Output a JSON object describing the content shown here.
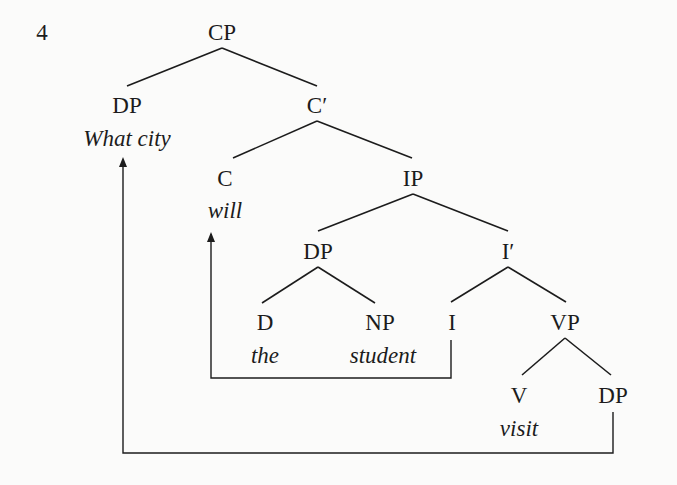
{
  "example_number": "4",
  "tree": {
    "nodes": [
      {
        "id": "cp",
        "label": "CP",
        "x": 222,
        "y": 32
      },
      {
        "id": "dp-spec",
        "label": "DP",
        "x": 127,
        "y": 105,
        "word": "What city",
        "wx": 127,
        "wy": 138
      },
      {
        "id": "c-bar",
        "label": "C′",
        "x": 317,
        "y": 105
      },
      {
        "id": "c",
        "label": "C",
        "x": 225,
        "y": 178,
        "word": "will",
        "wx": 225,
        "wy": 210
      },
      {
        "id": "ip",
        "label": "IP",
        "x": 413,
        "y": 178
      },
      {
        "id": "dp-subj",
        "label": "DP",
        "x": 318,
        "y": 251
      },
      {
        "id": "i-bar",
        "label": "I′",
        "x": 508,
        "y": 251
      },
      {
        "id": "d",
        "label": "D",
        "x": 265,
        "y": 322,
        "word": "the",
        "wx": 265,
        "wy": 355
      },
      {
        "id": "np",
        "label": "NP",
        "x": 380,
        "y": 322,
        "word": "student",
        "wx": 383,
        "wy": 355
      },
      {
        "id": "i",
        "label": "I",
        "x": 452,
        "y": 322
      },
      {
        "id": "vp",
        "label": "VP",
        "x": 565,
        "y": 322
      },
      {
        "id": "v",
        "label": "V",
        "x": 519,
        "y": 395,
        "word": "visit",
        "wx": 519,
        "wy": 428
      },
      {
        "id": "dp-obj",
        "label": "DP",
        "x": 613,
        "y": 395
      }
    ],
    "edges": [
      [
        222,
        48,
        127,
        86
      ],
      [
        222,
        48,
        317,
        86
      ],
      [
        317,
        121,
        233,
        158
      ],
      [
        317,
        121,
        412,
        158
      ],
      [
        413,
        194,
        318,
        231
      ],
      [
        413,
        194,
        508,
        231
      ],
      [
        318,
        267,
        262,
        303
      ],
      [
        318,
        267,
        375,
        303
      ],
      [
        508,
        267,
        451,
        302
      ],
      [
        508,
        267,
        566,
        302
      ],
      [
        565,
        338,
        522,
        375
      ],
      [
        565,
        338,
        611,
        375
      ]
    ],
    "movements": [
      {
        "name": "i-to-c-movement",
        "points": "451,340 451,378 211,378 211,234",
        "arrow_x": 211,
        "arrow_y": 232
      },
      {
        "name": "dp-to-spec-cp-movement",
        "points": "613,412 613,453 123,453 123,160",
        "arrow_x": 123,
        "arrow_y": 157
      }
    ]
  },
  "colors": {
    "ink": "#1c1c1c",
    "background": "#fbfbfa"
  }
}
